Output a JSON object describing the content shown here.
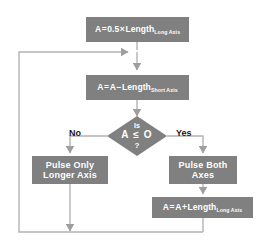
{
  "diagram": {
    "colors": {
      "node_fill": "#808080",
      "edge": "#b3b3b3",
      "arrow": "#9e9e9e",
      "node_text": "#ffffff",
      "label_text": "#1a1a1a",
      "background": "#ffffff"
    },
    "nodes": [
      {
        "id": "init",
        "type": "process",
        "lhs": "A",
        "eq": "=",
        "coefficient": "0.5",
        "times": "×",
        "term": "Length",
        "subscript": "Long Axis",
        "text": "A = 0.5 × Length Long Axis"
      },
      {
        "id": "subtract",
        "type": "process",
        "lhs": "A",
        "eq": "=",
        "operand": "A",
        "minus": "−",
        "term": "Length",
        "subscript": "Short Axis",
        "text": "A = A − Length Short Axis"
      },
      {
        "id": "decision",
        "type": "decision",
        "line1": "Is",
        "line2": "A ≤ O",
        "line3": "?",
        "text": "Is A ≤ O ?"
      },
      {
        "id": "pulse-longer",
        "type": "process",
        "line1": "Pulse Only",
        "line2": "Longer Axis",
        "text": "Pulse Only Longer Axis"
      },
      {
        "id": "pulse-both",
        "type": "process",
        "line1": "Pulse Both",
        "line2": "Axes",
        "text": "Pulse Both Axes"
      },
      {
        "id": "add",
        "type": "process",
        "lhs": "A",
        "eq": "=",
        "operand": "A",
        "plus": "+",
        "term": "Length",
        "subscript": "Long Axis",
        "text": "A = A + Length Long Axis"
      }
    ],
    "edge_labels": {
      "no": "No",
      "yes": "Yes"
    }
  }
}
